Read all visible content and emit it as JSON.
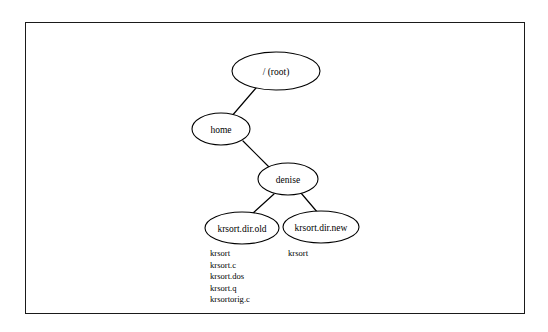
{
  "figure": {
    "border_color": "#1a1a1a",
    "background_color": "#ffffff",
    "stroke_color": "#000000"
  },
  "tree": {
    "nodes": [
      {
        "id": "root",
        "label": "/ (root)",
        "cx": 276,
        "cy": 71,
        "rx": 44,
        "ry": 19
      },
      {
        "id": "home",
        "label": "home",
        "cx": 221,
        "cy": 129,
        "rx": 29,
        "ry": 16
      },
      {
        "id": "denise",
        "label": "denise",
        "cx": 288,
        "cy": 179,
        "rx": 30,
        "ry": 16
      },
      {
        "id": "krsort-dir-old",
        "label": "krsort.dir.old",
        "cx": 242,
        "cy": 228,
        "rx": 37,
        "ry": 16
      },
      {
        "id": "krsort-dir-new",
        "label": "krsort.dir.new",
        "cx": 321,
        "cy": 227,
        "rx": 38,
        "ry": 16
      }
    ],
    "edges": [
      {
        "id": "root-home",
        "from": "root",
        "to": "home",
        "x1": 256,
        "y1": 88,
        "x2": 231,
        "y2": 117
      },
      {
        "id": "home-denise",
        "from": "home",
        "to": "denise",
        "x1": 243,
        "y1": 141,
        "x2": 269,
        "y2": 167
      },
      {
        "id": "denise-krsort-old",
        "from": "denise",
        "to": "krsort-dir-old",
        "x1": 274,
        "y1": 194,
        "x2": 252,
        "y2": 214
      },
      {
        "id": "denise-krsort-new",
        "from": "denise",
        "to": "krsort-dir-new",
        "x1": 301,
        "y1": 193,
        "x2": 318,
        "y2": 213
      }
    ]
  },
  "file_lists": [
    {
      "id": "krsort-dir-old-files",
      "parent": "krsort.dir.old",
      "x": 210,
      "y": 256,
      "line_height": 11.6,
      "files": [
        "krsort",
        "krsort.c",
        "krsort.dos",
        "krsort.q",
        "krsortorig.c"
      ]
    },
    {
      "id": "krsort-dir-new-files",
      "parent": "krsort.dir.new",
      "x": 288,
      "y": 256,
      "line_height": 11.6,
      "files": [
        "krsort"
      ]
    }
  ]
}
